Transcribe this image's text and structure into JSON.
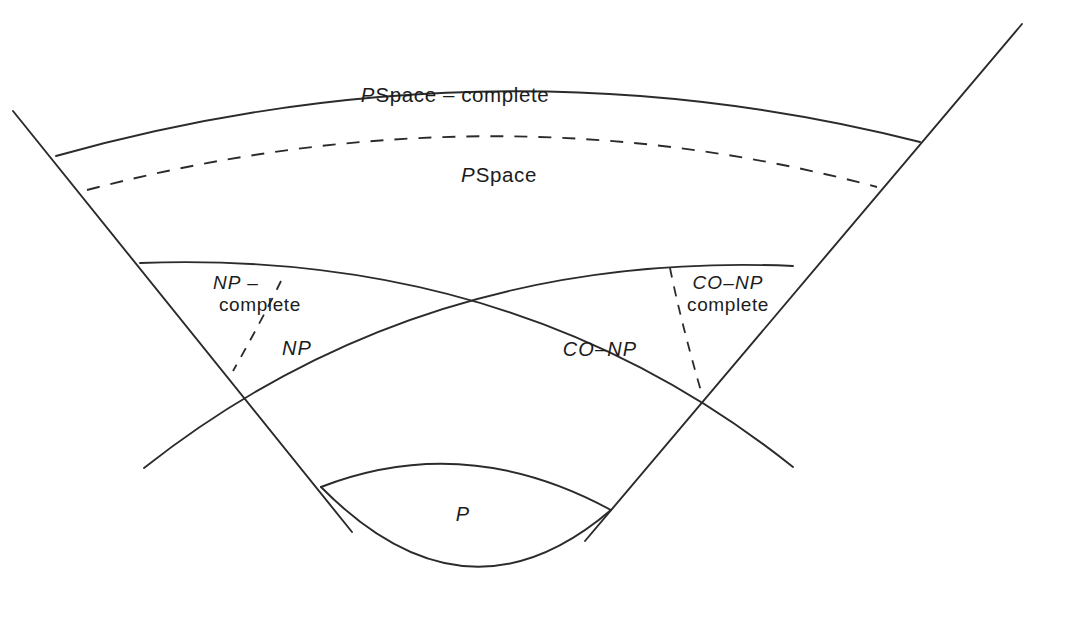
{
  "diagram": {
    "background_color": "#ffffff",
    "stroke_color": "#2b2b2b",
    "regions": [
      {
        "id": "pspace-complete",
        "label_italic": "P",
        "label_upright": "Space – complete",
        "boundary": "solid-outer-arc"
      },
      {
        "id": "pspace",
        "label_italic": "P",
        "label_upright": "Space",
        "boundary": "dashed-arc"
      },
      {
        "id": "np-complete",
        "label_line1_italic": "NP –",
        "label_line2_upright": "complete",
        "boundary": "dashed-radial-left"
      },
      {
        "id": "np",
        "label_italic": "NP",
        "boundary": "solid-arc-left"
      },
      {
        "id": "co-np",
        "label_italic": "CO–NP",
        "boundary": "solid-arc-right"
      },
      {
        "id": "co-np-complete",
        "label_line1_italic": "CO–NP",
        "label_line2_upright": "complete",
        "boundary": "dashed-radial-right"
      },
      {
        "id": "p",
        "label_italic": "P",
        "boundary": "lens"
      }
    ]
  },
  "labels": {
    "pspace_complete": {
      "italic": "P",
      "upright": "Space – complete"
    },
    "pspace": {
      "italic": "P",
      "upright": "Space"
    },
    "np_complete": {
      "line1": "NP –",
      "line2": "complete"
    },
    "np": {
      "italic": "NP"
    },
    "co_np": {
      "italic": "CO–NP"
    },
    "co_np_complete": {
      "line1": "CO–NP",
      "line2": "complete"
    },
    "p": {
      "italic": "P"
    }
  }
}
